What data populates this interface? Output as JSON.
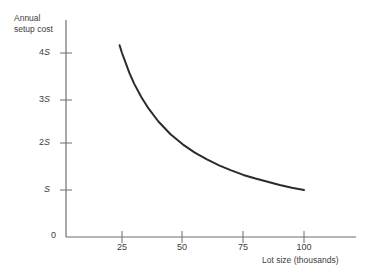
{
  "chart_data": {
    "type": "line",
    "title": "",
    "xlabel": "Lot size (thousands)",
    "ylabel": "Annual setup cost",
    "ylabel_line1": "Annual",
    "ylabel_line2": "setup cost",
    "xlim": [
      0,
      115
    ],
    "ylim": [
      0,
      4.8
    ],
    "grid": false,
    "legend": null,
    "xticks": [
      25,
      50,
      75,
      100
    ],
    "xtick_labels": [
      "25",
      "50",
      "75",
      "100"
    ],
    "yticks": [
      1,
      2,
      3,
      4
    ],
    "ytick_labels": [
      "S",
      "2S",
      "3S",
      "4S"
    ],
    "origin_label": "0",
    "curve_color": "#2b2b2b",
    "axis_color": "#6e6e6e",
    "series": [
      {
        "name": "Annual setup cost",
        "formula": "100S / x",
        "x": [
          24,
          25,
          28,
          30,
          33,
          36,
          40,
          45,
          50,
          55,
          60,
          65,
          70,
          75,
          80,
          85,
          90,
          95,
          100
        ],
        "values": [
          4.17,
          4.0,
          3.57,
          3.33,
          3.03,
          2.78,
          2.5,
          2.22,
          2.0,
          1.82,
          1.67,
          1.54,
          1.43,
          1.33,
          1.25,
          1.18,
          1.11,
          1.05,
          1.0
        ]
      }
    ]
  },
  "yticks_meta": [
    {
      "label": "4S",
      "prefix": "4",
      "sym": "S",
      "y": 53
    },
    {
      "label": "3S",
      "prefix": "3",
      "sym": "S",
      "y": 100
    },
    {
      "label": "2S",
      "prefix": "2",
      "sym": "S",
      "y": 143
    },
    {
      "label": "S",
      "prefix": "",
      "sym": "S",
      "y": 190
    }
  ],
  "xticks_meta": [
    {
      "label": "25",
      "x": 122
    },
    {
      "label": "50",
      "x": 182
    },
    {
      "label": "75",
      "x": 243
    },
    {
      "label": "100",
      "x": 304
    }
  ],
  "labels": {
    "origin": "0"
  }
}
